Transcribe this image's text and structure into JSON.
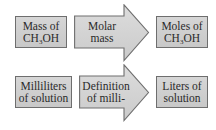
{
  "diagram": {
    "type": "conversion-flow",
    "rows": [
      {
        "start": {
          "line1": "Mass of",
          "line2_prefix": "CH",
          "line2_sub": "3",
          "line2_suffix": "OH"
        },
        "conversion": {
          "line1": "Molar",
          "line2": "mass"
        },
        "end": {
          "line1": "Moles of",
          "line2_prefix": "CH",
          "line2_sub": "3",
          "line2_suffix": "OH"
        }
      },
      {
        "start": {
          "line1": "Milliliters",
          "line2": "of solution"
        },
        "conversion": {
          "line1": "Definition",
          "line2": "of milli-"
        },
        "end": {
          "line1": "Liters of",
          "line2": "solution"
        }
      }
    ],
    "colors": {
      "box_fill": "#cfcfcf",
      "box_border": "#6e6e6e",
      "arrow_fill": "#d4d4d4",
      "text": "#2a2a2a"
    }
  }
}
